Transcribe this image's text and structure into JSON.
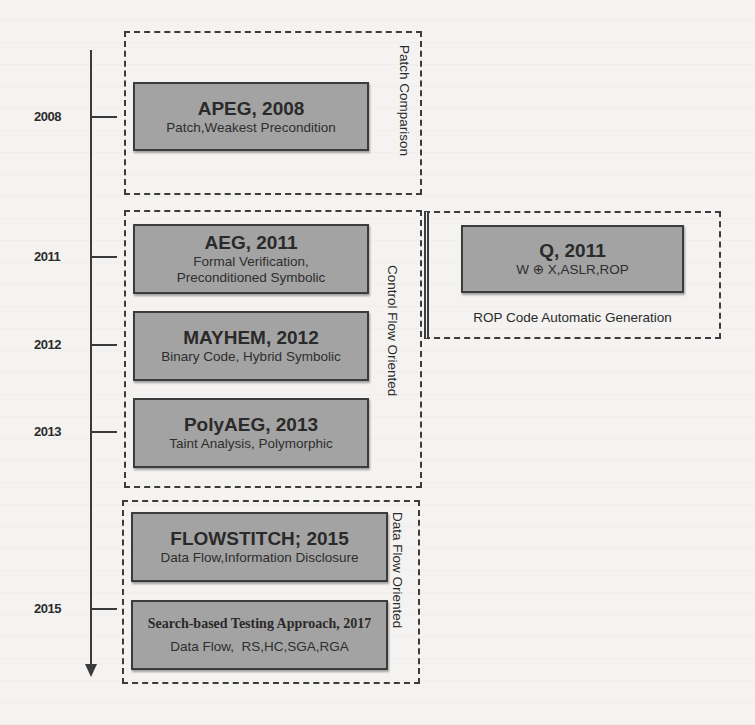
{
  "timeline": {
    "years": [
      {
        "label": "2008",
        "y": 117
      },
      {
        "label": "2011",
        "y": 257
      },
      {
        "label": "2012",
        "y": 345
      },
      {
        "label": "2013",
        "y": 432
      },
      {
        "label": "2015",
        "y": 609
      }
    ]
  },
  "groups": {
    "patch": {
      "label": "Patch Comparison"
    },
    "control": {
      "label": "Control Flow Oriented"
    },
    "data": {
      "label": "Data Flow Oriented"
    },
    "rop": {
      "label": "ROP Code Automatic Generation"
    }
  },
  "boxes": {
    "apeg": {
      "title": "APEG, 2008",
      "sub": "Patch,Weakest Precondition"
    },
    "aeg": {
      "title": "AEG, 2011",
      "sub1": "Formal Verification,",
      "sub2": "Preconditioned Symbolic"
    },
    "mayhem": {
      "title": "MAYHEM, 2012",
      "sub": "Binary Code, Hybrid Symbolic"
    },
    "polyaeg": {
      "title": "PolyAEG, 2013",
      "sub": "Taint Analysis, Polymorphic"
    },
    "q": {
      "title": "Q, 2011",
      "sub": "W ⊕ X,ASLR,ROP"
    },
    "flowstitch": {
      "title": "FLOWSTITCH; 2015",
      "sub": "Data Flow,Information Disclosure"
    },
    "search": {
      "title": "Search-based Testing Approach, 2017",
      "sub": "Data Flow,  RS,HC,SGA,RGA"
    }
  },
  "colors": {
    "box_fill": "#a3a3a3",
    "border": "#3c3c3c",
    "background": "#f4f3f1"
  }
}
